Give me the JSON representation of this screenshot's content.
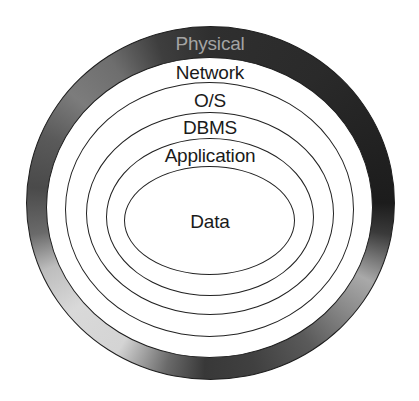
{
  "diagram": {
    "type": "concentric-layers",
    "layers": [
      {
        "label": "Physical",
        "position": "outermost",
        "style": "shaded-ring"
      },
      {
        "label": "Network",
        "position": "ring-2"
      },
      {
        "label": "O/S",
        "position": "ring-3"
      },
      {
        "label": "DBMS",
        "position": "ring-4"
      },
      {
        "label": "Application",
        "position": "ring-5"
      },
      {
        "label": "Data",
        "position": "core"
      }
    ],
    "colors": {
      "outline": "#222222",
      "outer_ring_dark": "#2a2a2a",
      "outer_ring_light": "#d4d4d4",
      "physical_text": "#b8b8b8",
      "label_text": "#1a1a1a",
      "background": "#ffffff"
    }
  }
}
